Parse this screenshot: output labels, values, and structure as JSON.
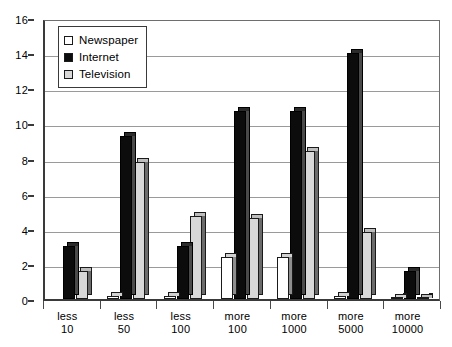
{
  "chart_data": {
    "type": "bar",
    "title": "",
    "xlabel": "",
    "ylabel": "",
    "ylim": [
      0,
      16
    ],
    "ytick_step": 2,
    "yticks": [
      0,
      2,
      4,
      6,
      8,
      10,
      12,
      14,
      16
    ],
    "grid": true,
    "grid_axis": "y",
    "legend_position": "top-left",
    "categories": [
      "less\n10",
      "less\n50",
      "less\n100",
      "more\n100",
      "more\n1000",
      "more\n5000",
      "more\n10000"
    ],
    "category_lines": [
      [
        "less",
        "10"
      ],
      [
        "less",
        "50"
      ],
      [
        "less",
        "100"
      ],
      [
        "more",
        "100"
      ],
      [
        "more",
        "1000"
      ],
      [
        "more",
        "5000"
      ],
      [
        "more",
        "10000"
      ]
    ],
    "series": [
      {
        "name": "Newspaper",
        "color": "#ffffff",
        "values": [
          0.0,
          0.15,
          0.2,
          2.4,
          2.4,
          0.15,
          0.05
        ]
      },
      {
        "name": "Internet",
        "color": "#0c0c0c",
        "values": [
          3.0,
          9.3,
          3.0,
          10.7,
          10.7,
          14.0,
          1.6
        ]
      },
      {
        "name": "Television",
        "color": "#d8d8d8",
        "values": [
          1.6,
          7.8,
          4.7,
          4.6,
          8.4,
          3.8,
          0.05
        ]
      }
    ]
  },
  "legend": {
    "items": [
      {
        "label": "Newspaper",
        "swatch": "newspaper"
      },
      {
        "label": "Internet",
        "swatch": "internet"
      },
      {
        "label": "Television",
        "swatch": "television"
      }
    ]
  },
  "colors": {
    "newspaper": "#ffffff",
    "internet": "#0c0c0c",
    "television": "#d8d8d8",
    "axis": "#3a3a3a",
    "gridline": "#9a9a9a",
    "background": "#ffffff"
  }
}
